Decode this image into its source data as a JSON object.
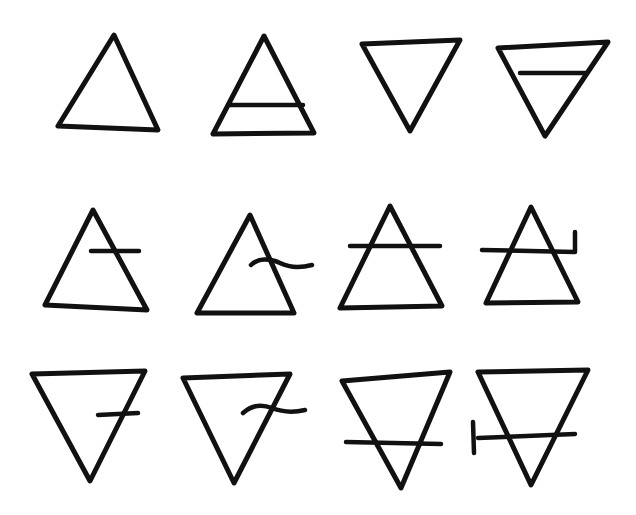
{
  "title": "Hand-drawn alchemical element symbols",
  "colors": {
    "ink": "#111111",
    "background": "#ffffff"
  },
  "stroke_width": 5,
  "symbols": [
    {
      "name": "fire",
      "row": 1,
      "col": 1,
      "orientation": "up",
      "bar": "none",
      "paths": [
        "M114 35 L58 126 L158 130 Z"
      ]
    },
    {
      "name": "air",
      "row": 1,
      "col": 2,
      "orientation": "up",
      "bar": "full-horizontal",
      "paths": [
        "M264 36 L213 134 L314 133 Z",
        "M228 105 L303 105"
      ]
    },
    {
      "name": "water",
      "row": 1,
      "col": 3,
      "orientation": "down",
      "bar": "none",
      "paths": [
        "M362 44 L460 40 L410 131 Z"
      ]
    },
    {
      "name": "earth",
      "row": 1,
      "col": 4,
      "orientation": "down",
      "bar": "full-horizontal",
      "paths": [
        "M498 48 L608 42 L545 136 Z",
        "M520 73 L587 73"
      ]
    },
    {
      "name": "variant-up-short-bar",
      "row": 2,
      "col": 1,
      "orientation": "up",
      "bar": "short-right",
      "paths": [
        "M93 210 L45 305 L147 310 Z",
        "M91 251 L139 251"
      ]
    },
    {
      "name": "variant-up-wavy-bar",
      "row": 2,
      "col": 2,
      "orientation": "up",
      "bar": "wavy-right",
      "paths": [
        "M250 215 L197 313 L294 313 Z",
        "M251 265 C258 258 270 258 280 263 C290 268 300 268 312 265"
      ]
    },
    {
      "name": "variant-up-crossbar",
      "row": 2,
      "col": 3,
      "orientation": "up",
      "bar": "crossing",
      "paths": [
        "M390 206 L340 308 L442 306 Z",
        "M350 246 L440 246"
      ]
    },
    {
      "name": "variant-up-hooked-bar",
      "row": 2,
      "col": 4,
      "orientation": "up",
      "bar": "crossing-hooked",
      "paths": [
        "M531 207 L486 303 L578 302 Z",
        "M482 250 L575 252 L575 232"
      ]
    },
    {
      "name": "variant-down-short-bar",
      "row": 3,
      "col": 1,
      "orientation": "down",
      "bar": "short-right",
      "paths": [
        "M32 374 L145 371 L90 481 Z",
        "M98 415 L138 413"
      ]
    },
    {
      "name": "variant-down-wavy-bar",
      "row": 3,
      "col": 2,
      "orientation": "down",
      "bar": "wavy-right",
      "paths": [
        "M183 378 L290 374 L234 483 Z",
        "M243 413 C252 405 262 404 272 408 C282 412 292 413 305 410"
      ]
    },
    {
      "name": "variant-down-crossbar",
      "row": 3,
      "col": 3,
      "orientation": "down",
      "bar": "crossing",
      "paths": [
        "M342 381 L450 372 L401 488 Z",
        "M346 442 L441 444"
      ]
    },
    {
      "name": "variant-down-hooked-bar",
      "row": 3,
      "col": 4,
      "orientation": "down",
      "bar": "crossing-tick",
      "paths": [
        "M478 372 L588 370 L531 485 Z",
        "M478 438 L575 434",
        "M473 422 L474 453"
      ]
    }
  ]
}
